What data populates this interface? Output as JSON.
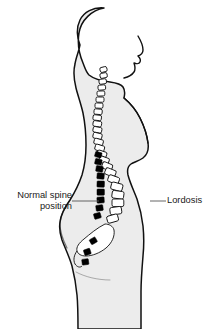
{
  "figure": {
    "colors": {
      "background": "#ffffff",
      "body_fill": "#ececec",
      "body_outline": "#000000",
      "vertebra_normal_fill": "#000000",
      "vertebra_lordosis_fill": "#ffffff",
      "vertebra_outline": "#000000",
      "leader_line": "#555555",
      "text": "#1a1a1a"
    }
  },
  "annotations": {
    "left": {
      "line1": "Normal spine",
      "line2": "position",
      "points_to": "black-vertebrae-column",
      "leader_from_x": 72,
      "leader_to_x": 99,
      "leader_y": 201
    },
    "right": {
      "label": "Lordosis",
      "points_to": "white-vertebrae-column",
      "leader_from_x": 150,
      "leader_to_x": 166,
      "leader_y": 201
    }
  },
  "spine": {
    "description": "Vertebral column drawn in profile with an exaggerated lumbar curve",
    "segments": [
      {
        "name": "cervical",
        "vertebra_count": 7,
        "fill": "white"
      },
      {
        "name": "thoracic",
        "vertebra_count": 12,
        "fill": "white"
      },
      {
        "name": "lumbar",
        "vertebra_count": 5,
        "fill": "white"
      },
      {
        "name": "sacrum",
        "vertebra_count": 1,
        "fill": "white"
      },
      {
        "name": "normal-position-markers",
        "vertebra_count": 12,
        "fill": "black"
      }
    ]
  }
}
